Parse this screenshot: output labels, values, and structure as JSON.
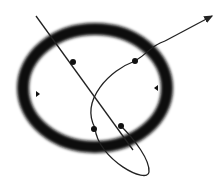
{
  "diagram": {
    "colors": {
      "ring": "#111111",
      "line": "#222222",
      "background": "#ffffff"
    },
    "ring": {
      "cx": 95,
      "cy": 88,
      "rx": 72,
      "ry": 59,
      "stroke_width": 12
    },
    "straight_line": {
      "x1": 36,
      "y1": 16,
      "x2": 133,
      "y2": 150
    },
    "curve": {
      "path": "M165 42 L 149 40 C 110 60, 80 95, 95 128 C 110 160, 150 185, 148 160 C 145 140, 130 130, 95 128"
    },
    "dots": [
      {
        "x": 73,
        "y": 62
      },
      {
        "x": 135,
        "y": 61
      },
      {
        "x": 94,
        "y": 129
      },
      {
        "x": 121,
        "y": 126
      }
    ],
    "markers": [
      {
        "x": 37,
        "y": 94,
        "direction": "right"
      },
      {
        "x": 157,
        "y": 88,
        "direction": "left"
      }
    ]
  }
}
